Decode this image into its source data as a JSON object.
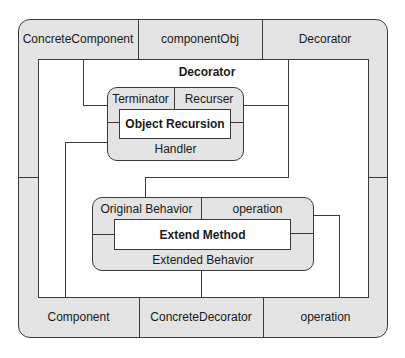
{
  "diagram": {
    "top_band": [
      "ConcreteComponent",
      "componentObj",
      "Decorator"
    ],
    "bottom_band": [
      "Component",
      "ConcreteDecorator",
      "operation"
    ],
    "center_title": "Decorator",
    "handler_box": {
      "top_left": "Terminator",
      "top_right": "Recurser",
      "center": "Object Recursion",
      "bottom": "Handler"
    },
    "extended_box": {
      "top_left": "Original Behavior",
      "top_right": "operation",
      "center": "Extend Method",
      "bottom": "Extended Behavior"
    },
    "colors": {
      "fill": "#e3e3e3",
      "stroke": "#3a3a3a",
      "inner": "#ffffff"
    }
  }
}
